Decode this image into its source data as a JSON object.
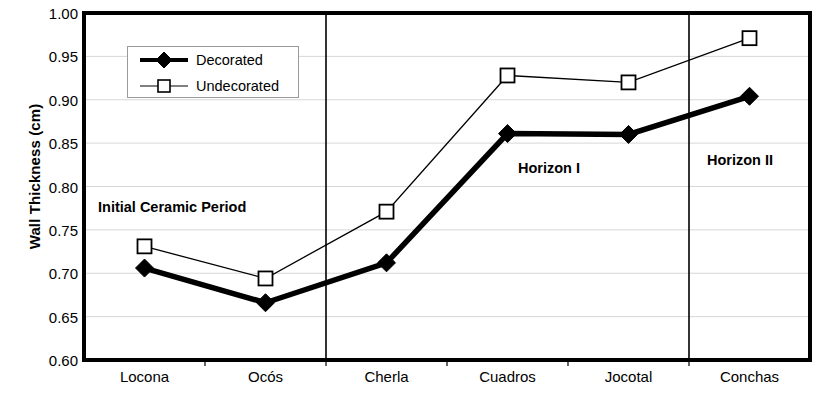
{
  "chart_data": {
    "type": "line",
    "title": "",
    "xlabel": "",
    "ylabel": "Wall Thickness (cm)",
    "categories": [
      "Locona",
      "Ocós",
      "Cherla",
      "Cuadros",
      "Jocotal",
      "Conchas"
    ],
    "ylim": [
      0.6,
      1.0
    ],
    "yticks": [
      "1.00",
      "0.95",
      "0.90",
      "0.85",
      "0.80",
      "0.75",
      "0.70",
      "0.65",
      "0.60"
    ],
    "ytick_values": [
      1.0,
      0.95,
      0.9,
      0.85,
      0.8,
      0.75,
      0.7,
      0.65,
      0.6
    ],
    "grid": true,
    "legend_position": "top-left-inside",
    "series": [
      {
        "name": "Decorated",
        "marker": "filled-diamond",
        "line_style": "thick-solid",
        "color": "#000000",
        "values": [
          0.706,
          0.666,
          0.712,
          0.861,
          0.86,
          0.904
        ]
      },
      {
        "name": "Undecorated",
        "marker": "open-square",
        "line_style": "thin-solid",
        "color": "#000000",
        "values": [
          0.731,
          0.694,
          0.771,
          0.928,
          0.92,
          0.971
        ]
      }
    ],
    "annotations": [
      {
        "text": "Initial Ceramic Period",
        "x_category_span": [
          "Locona",
          "Ocós"
        ],
        "y_value": 0.788
      },
      {
        "text": "Horizon I",
        "x_category_span": [
          "Cherla",
          "Jocotal"
        ],
        "y_value": 0.833
      },
      {
        "text": "Horizon II",
        "x_category_span": [
          "Conchas",
          "Conchas"
        ],
        "y_value": 0.845
      }
    ],
    "dividers": [
      {
        "after_category": "Ocós"
      },
      {
        "after_category": "Jocotal"
      }
    ]
  },
  "legend": {
    "entries": [
      {
        "label": "Decorated"
      },
      {
        "label": "Undecorated"
      }
    ]
  }
}
